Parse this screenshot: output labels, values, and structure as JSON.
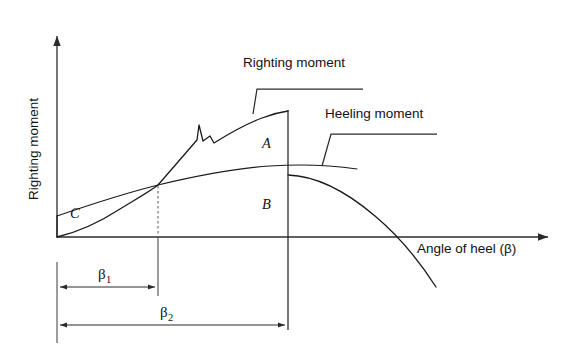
{
  "figure": {
    "title_alt": "Righting and heeling moment curves versus angle of heel",
    "background_color": "#ffffff",
    "line_color": "#1a1a1a"
  },
  "axes": {
    "y_label": "Righting moment",
    "x_label": "Angle of heel (β)",
    "origin": {
      "x": 57,
      "y": 237
    },
    "y_axis_top": {
      "x": 57,
      "y": 32
    },
    "x_axis_right": {
      "x": 553,
      "y": 237
    }
  },
  "curves": [
    {
      "name": "righting-moment",
      "label": "Righting moment",
      "label_x": 243,
      "label_y": 67,
      "leader": "M253,114 L257,89 L363,89"
    },
    {
      "name": "heeling-moment",
      "label": "Heeling moment",
      "label_x": 325,
      "label_y": 118,
      "leader": "M322,166 L331,134 L437,134"
    }
  ],
  "regions": [
    {
      "name": "region-a",
      "label": "A",
      "x": 262,
      "y": 148
    },
    {
      "name": "region-b",
      "label": "B",
      "x": 262,
      "y": 209
    },
    {
      "name": "region-c",
      "label": "C",
      "x": 70,
      "y": 218
    }
  ],
  "dimensions": [
    {
      "name": "beta-1",
      "label": "β",
      "subscript": "1",
      "label_x": 98,
      "label_y": 279,
      "line_y": 287,
      "x_start": 57,
      "x_end": 158
    },
    {
      "name": "beta-2",
      "label": "β",
      "subscript": "2",
      "label_x": 160,
      "label_y": 317,
      "line_y": 325,
      "x_start": 57,
      "x_end": 288
    }
  ],
  "markers": {
    "intersection_x": 158,
    "intersection_y": 185,
    "vertical_cut_x": 288
  }
}
